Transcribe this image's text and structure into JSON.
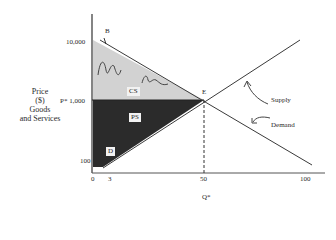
{
  "diagram": {
    "y_axis_label": [
      "Price",
      "($)",
      "Goods",
      "and Services"
    ],
    "y_ticks": [
      {
        "label": "10,000",
        "y": 42
      },
      {
        "label": "P* 1,000",
        "y": 101
      },
      {
        "label": "100",
        "y": 162
      }
    ],
    "x_ticks": [
      {
        "label": "0",
        "x": 93
      },
      {
        "label": "3",
        "x": 110
      },
      {
        "label": "50",
        "x": 204
      },
      {
        "label": "100",
        "x": 306
      }
    ],
    "x_axis_label": "Q*",
    "points": {
      "B": "B",
      "E": "E"
    },
    "regions": {
      "CS": "CS",
      "PS": "PS",
      "D": "D"
    },
    "curves": {
      "supply": "Supply",
      "demand": "Demand"
    },
    "colors": {
      "cs_fill": "#cfcfcf",
      "ps_fill": "#2e2e2e",
      "line": "#3a3a3a"
    }
  }
}
